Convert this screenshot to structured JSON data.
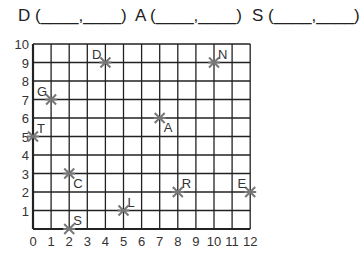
{
  "questions": [
    {
      "label": "D (____,____)",
      "x": 18
    },
    {
      "label": "A (____,____)",
      "x": 135
    },
    {
      "label": "S (____,____)",
      "x": 252
    }
  ],
  "grid": {
    "x_ticks": [
      "0",
      "1",
      "2",
      "3",
      "4",
      "5",
      "6",
      "7",
      "8",
      "9",
      "10",
      "11",
      "12"
    ],
    "y_ticks": [
      "0",
      "1",
      "2",
      "3",
      "4",
      "5",
      "6",
      "7",
      "8",
      "9",
      "10"
    ],
    "xmax": 12,
    "ymax": 10
  },
  "points": [
    {
      "name": "D",
      "x": 4,
      "y": 9
    },
    {
      "name": "N",
      "x": 10,
      "y": 9
    },
    {
      "name": "G",
      "x": 1,
      "y": 7
    },
    {
      "name": "A",
      "x": 7,
      "y": 6
    },
    {
      "name": "T",
      "x": 0,
      "y": 5
    },
    {
      "name": "C",
      "x": 2,
      "y": 3
    },
    {
      "name": "R",
      "x": 8,
      "y": 2
    },
    {
      "name": "E",
      "x": 12,
      "y": 2
    },
    {
      "name": "L",
      "x": 5,
      "y": 1
    },
    {
      "name": "S",
      "x": 2,
      "y": 0
    }
  ]
}
